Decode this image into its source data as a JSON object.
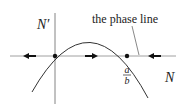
{
  "diagram": {
    "type": "phase-line-diagram",
    "y_axis_label": "N′",
    "x_axis_label": "N",
    "annotation": "the phase line",
    "equilibrium_label": {
      "numerator": "a",
      "denominator": "b"
    },
    "equilibria": [
      "0",
      "a/b"
    ],
    "flow_arrows": [
      {
        "region": "N < 0",
        "direction": "left"
      },
      {
        "region": "0 < N < a/b",
        "direction": "right"
      },
      {
        "region": "N > a/b",
        "direction": "left"
      }
    ],
    "curve": "downward parabola N' = N(a - bN)",
    "colors": {
      "ink": "#222222",
      "background": "#ffffff"
    }
  }
}
